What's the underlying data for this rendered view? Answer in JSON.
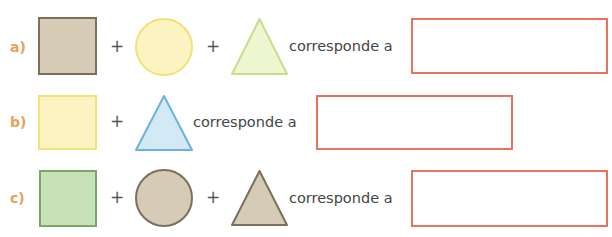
{
  "connector_text": "corresponde a",
  "plus_sign": "+",
  "colors": {
    "label": "#e9a15a",
    "answer_border": "#e8735a",
    "text": "#454545"
  },
  "rows": [
    {
      "label": "a)",
      "shapes": [
        {
          "type": "square",
          "fill": "#d6cbb7",
          "stroke": "#7d6f5a"
        },
        {
          "type": "circle",
          "fill": "#fbf3c0",
          "stroke": "#f1e27d"
        },
        {
          "type": "triangle",
          "fill": "#eef6cf",
          "stroke": "#c6dd8d"
        }
      ],
      "answer_value": ""
    },
    {
      "label": "b)",
      "shapes": [
        {
          "type": "square",
          "fill": "#fbf3c0",
          "stroke": "#f1e27d"
        },
        {
          "type": "triangle",
          "fill": "#d3eaf6",
          "stroke": "#6fb1d9"
        }
      ],
      "answer_value": ""
    },
    {
      "label": "c)",
      "shapes": [
        {
          "type": "square",
          "fill": "#c9e1b6",
          "stroke": "#78a866"
        },
        {
          "type": "circle",
          "fill": "#d6cbb7",
          "stroke": "#7d6f5a"
        },
        {
          "type": "triangle",
          "fill": "#d6cbb7",
          "stroke": "#7d6f5a"
        }
      ],
      "answer_value": ""
    }
  ]
}
